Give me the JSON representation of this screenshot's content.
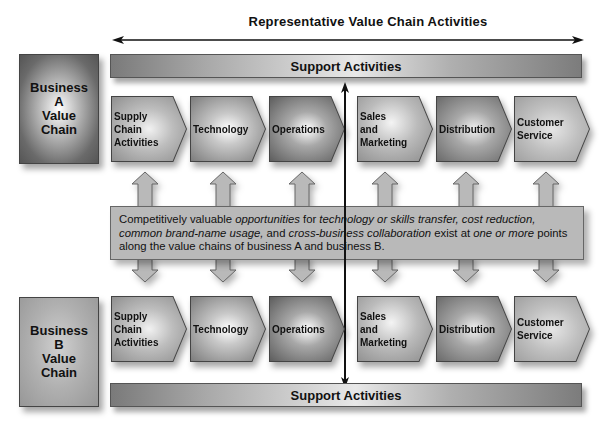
{
  "header": {
    "title": "Representative Value Chain Activities"
  },
  "support_top": {
    "label": "Support Activities"
  },
  "support_bottom": {
    "label": "Support Activities"
  },
  "business_a": {
    "lines": [
      "Business",
      "A",
      "Value",
      "Chain"
    ]
  },
  "business_b": {
    "lines": [
      "Business",
      "B",
      "Value",
      "Chain"
    ]
  },
  "activities_a": [
    {
      "lines": [
        "Supply",
        "Chain",
        "Activities"
      ]
    },
    {
      "lines": [
        "Technology"
      ]
    },
    {
      "lines": [
        "Operations"
      ]
    },
    {
      "lines": [
        "Sales",
        "and",
        "Marketing"
      ]
    },
    {
      "lines": [
        "Distribution"
      ]
    },
    {
      "lines": [
        "Customer",
        "Service"
      ]
    }
  ],
  "activities_b": [
    {
      "lines": [
        "Supply",
        "Chain",
        "Activities"
      ]
    },
    {
      "lines": [
        "Technology"
      ]
    },
    {
      "lines": [
        "Operations"
      ]
    },
    {
      "lines": [
        "Sales",
        "and",
        "Marketing"
      ]
    },
    {
      "lines": [
        "Distribution"
      ]
    },
    {
      "lines": [
        "Customer",
        "Service"
      ]
    }
  ],
  "opportunity": {
    "segments": [
      {
        "text": "Competitively valuable ",
        "italic": false
      },
      {
        "text": "opportunities",
        "italic": true
      },
      {
        "text": " for ",
        "italic": false
      },
      {
        "text": "technology or skills transfer, cost reduction, common brand-name usage,",
        "italic": true
      },
      {
        "text": " and ",
        "italic": false
      },
      {
        "text": "cross-business collaboration",
        "italic": true
      },
      {
        "text": " exist at ",
        "italic": false
      },
      {
        "text": "one or more",
        "italic": true
      },
      {
        "text": " points along the value chains of business A and business B.",
        "italic": false
      }
    ]
  },
  "colors": {
    "arrow": "#111111",
    "connector_fill": "#b9b9b9",
    "connector_stroke": "#666666",
    "band_fill": "#b9b9b9"
  }
}
